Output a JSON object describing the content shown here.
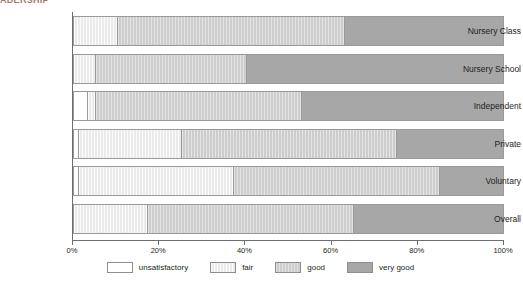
{
  "heading_fragment": "ADERSHIP",
  "chart_data": {
    "type": "bar",
    "orientation": "horizontal",
    "stacked": true,
    "normalized": true,
    "title": "",
    "subtitle": "",
    "xlabel": "",
    "ylabel": "",
    "xlim": [
      0,
      100
    ],
    "grid": false,
    "legend_position": "bottom",
    "categories": [
      "Nursery Class",
      "Nursery School",
      "Independent",
      "Private",
      "Voluntary",
      "Overall"
    ],
    "series": [
      {
        "name": "unsatisfactory",
        "color": "#ffffff",
        "values": [
          0,
          0,
          3,
          1,
          1,
          0
        ]
      },
      {
        "name": "fair",
        "color": "#ebebeb",
        "values": [
          10,
          5,
          2,
          24,
          36,
          17
        ]
      },
      {
        "name": "good",
        "color": "#cdcdcd",
        "values": [
          53,
          35,
          48,
          50,
          48,
          48
        ]
      },
      {
        "name": "very good",
        "color": "#a7a7a7",
        "values": [
          37,
          60,
          47,
          25,
          15,
          35
        ]
      }
    ],
    "xticks": [
      0,
      20,
      40,
      60,
      80,
      100
    ],
    "xticklabels": [
      "0%",
      "20%",
      "40%",
      "60%",
      "80%",
      "100%"
    ]
  },
  "legend": {
    "items": [
      {
        "label": "unsatisfactory",
        "key": "unsatisfactory"
      },
      {
        "label": "fair",
        "key": "fair"
      },
      {
        "label": "good",
        "key": "good"
      },
      {
        "label": "very good",
        "key": "verygood"
      }
    ]
  }
}
